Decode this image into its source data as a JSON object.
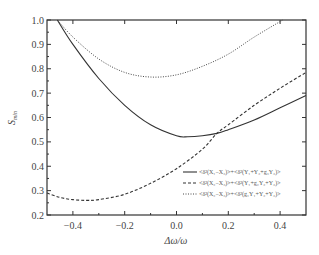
{
  "chart_data": {
    "type": "line",
    "title": "",
    "xlabel": "Δω/ω",
    "ylabel": "S_min",
    "xlim": [
      -0.5,
      0.5
    ],
    "ylim": [
      0.2,
      1.0
    ],
    "xticks": [
      "-0.4",
      "-0.2",
      "0.0",
      "0.2",
      "0.4"
    ],
    "yticks": [
      "0.2",
      "0.3",
      "0.4",
      "0.5",
      "0.6",
      "0.7",
      "0.8",
      "0.9",
      "1.0"
    ],
    "grid": false,
    "legend_position": "lower right",
    "series": [
      {
        "name": "<δ²(X₁−X₂)>+<δ²(Y₁+Y₂+g₃Y₃)>",
        "style": "solid",
        "x": [
          -0.46,
          -0.4,
          -0.3,
          -0.2,
          -0.1,
          0.0,
          0.044,
          0.1,
          0.156,
          0.2,
          0.3,
          0.4,
          0.5
        ],
        "y": [
          1.0,
          0.9,
          0.76,
          0.65,
          0.57,
          0.525,
          0.521,
          0.525,
          0.535,
          0.55,
          0.59,
          0.64,
          0.69
        ]
      },
      {
        "name": "<δ²(X₂−X₃)>+<δ²(Y₁+g₂Y₂+Y₃)>",
        "style": "dashed",
        "x": [
          -0.5,
          -0.45,
          -0.4,
          -0.347,
          -0.3,
          -0.2,
          -0.1,
          0.0,
          0.1,
          0.156,
          0.2,
          0.3,
          0.4,
          0.5
        ],
        "y": [
          0.29,
          0.272,
          0.263,
          0.26,
          0.263,
          0.285,
          0.33,
          0.39,
          0.47,
          0.535,
          0.57,
          0.65,
          0.72,
          0.785
        ]
      },
      {
        "name": "<δ²(X₂−X₃)>+<δ²(g₁Y₁+Y₂+Y₃)>",
        "style": "dotted",
        "x": [
          -0.46,
          -0.4,
          -0.3,
          -0.2,
          -0.1,
          0.0,
          0.1,
          0.2,
          0.3,
          0.41
        ],
        "y": [
          1.0,
          0.93,
          0.84,
          0.785,
          0.766,
          0.775,
          0.81,
          0.86,
          0.93,
          1.0
        ]
      }
    ]
  },
  "legend": {
    "items": [
      {
        "label": "<δ²(X₁−X₂)>+<δ²(Y₁+Y₂+g₃Y₃)>",
        "style": "solid"
      },
      {
        "label": "<δ²(X₂−X₃)>+<δ²(Y₁+g₂Y₂+Y₃)>",
        "style": "dashed"
      },
      {
        "label": "<δ²(X₂−X₃)>+<δ²(g₁Y₁+Y₂+Y₃)>",
        "style": "dotted"
      }
    ]
  },
  "axes": {
    "xlabel": "Δω/ω",
    "ylabel_main": "S",
    "ylabel_sub": "min"
  }
}
